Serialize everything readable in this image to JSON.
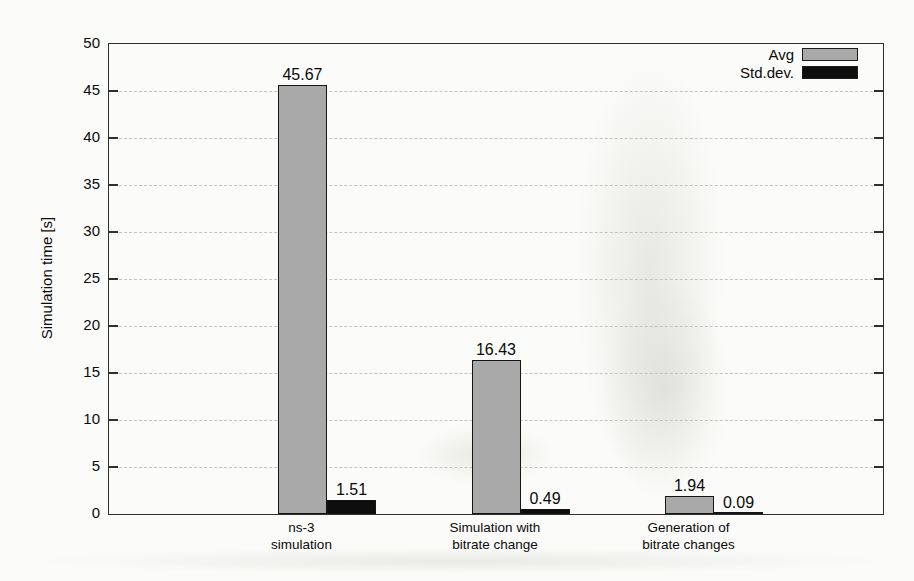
{
  "chart_data": {
    "type": "bar",
    "title": "",
    "xlabel": "",
    "ylabel": "Simulation time [s]",
    "ylim": [
      0,
      50
    ],
    "yticks": [
      0,
      5,
      10,
      15,
      20,
      25,
      30,
      35,
      40,
      45,
      50
    ],
    "grid": "horizontal-dashed",
    "legend_position": "top-right-inside",
    "categories": [
      {
        "line1": "ns-3",
        "line2": "simulation"
      },
      {
        "line1": "Simulation with",
        "line2": "bitrate change"
      },
      {
        "line1": "Generation of",
        "line2": "bitrate changes"
      }
    ],
    "series": [
      {
        "name": "Avg",
        "color": "#a9a9a9",
        "values": [
          45.67,
          16.43,
          1.94
        ],
        "value_labels": [
          "45.67",
          "16.43",
          "1.94"
        ]
      },
      {
        "name": "Std.dev.",
        "color": "#0e0e0e",
        "values": [
          1.51,
          0.49,
          0.09
        ],
        "value_labels": [
          "1.51",
          "0.49",
          "0.09"
        ]
      }
    ]
  },
  "colors": {
    "frame": "#2f2f2f",
    "grid": "#c3c3c0",
    "text": "#0a0a0a",
    "background": "#fbfbf9",
    "avg_bar": "#a9a9a9",
    "stddev_bar": "#0e0e0e"
  }
}
